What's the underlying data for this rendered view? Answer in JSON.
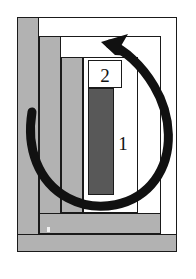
{
  "figure": {
    "kind": "technical-block-diagram",
    "width": 196,
    "height": 279,
    "background_color": "#ffffff",
    "description_visible_text": [
      "2",
      "1"
    ]
  },
  "colors": {
    "outline": "#1a1a1a",
    "white_fill": "#ffffff",
    "light_gray_fill": "#b2b2b2",
    "dark_gray_fill": "#585858",
    "arrow": "#111111",
    "page_background": "#ffffff"
  },
  "labels": {
    "inner_upper": "2",
    "inner_lower": "1"
  },
  "blocks": [
    {
      "name": "outer-frame",
      "fill": "#ffffff",
      "x": 17,
      "y": 17,
      "w": 160,
      "h": 235
    },
    {
      "name": "outer-left-column",
      "fill": "#b2b2b2",
      "x": 17,
      "y": 17,
      "w": 22,
      "h": 235
    },
    {
      "name": "second-frame",
      "fill": "#ffffff",
      "x": 39,
      "y": 36,
      "w": 122,
      "h": 198
    },
    {
      "name": "second-left-column",
      "fill": "#b2b2b2",
      "x": 39,
      "y": 36,
      "w": 22,
      "h": 198
    },
    {
      "name": "third-frame",
      "fill": "#ffffff",
      "x": 61,
      "y": 57,
      "w": 77,
      "h": 156
    },
    {
      "name": "third-left-column",
      "fill": "#b2b2b2",
      "x": 61,
      "y": 57,
      "w": 22,
      "h": 156
    },
    {
      "name": "inner-white-panel",
      "fill": "#ffffff",
      "x": 83,
      "y": 57,
      "w": 55,
      "h": 156
    },
    {
      "name": "label-2-cell",
      "fill": "#ffffff",
      "x": 88,
      "y": 60,
      "w": 34,
      "h": 28
    },
    {
      "name": "dark-core-bar",
      "fill": "#585858",
      "x": 88,
      "y": 88,
      "w": 26,
      "h": 107
    },
    {
      "name": "lower-horizontal-band",
      "fill": "#b2b2b2",
      "x": 39,
      "y": 213,
      "w": 122,
      "h": 21
    },
    {
      "name": "base-horizontal-band",
      "fill": "#b2b2b2",
      "x": 17,
      "y": 234,
      "w": 160,
      "h": 18
    }
  ],
  "arrow": {
    "name": "counter-clockwise-rotation-arrow",
    "color": "#111111",
    "stroke_width": 9,
    "direction": "counter-clockwise",
    "head_position": {
      "x": 104,
      "y": 43
    },
    "head_points_toward": "upper-left",
    "tail_position": {
      "x": 32,
      "y": 112
    }
  }
}
